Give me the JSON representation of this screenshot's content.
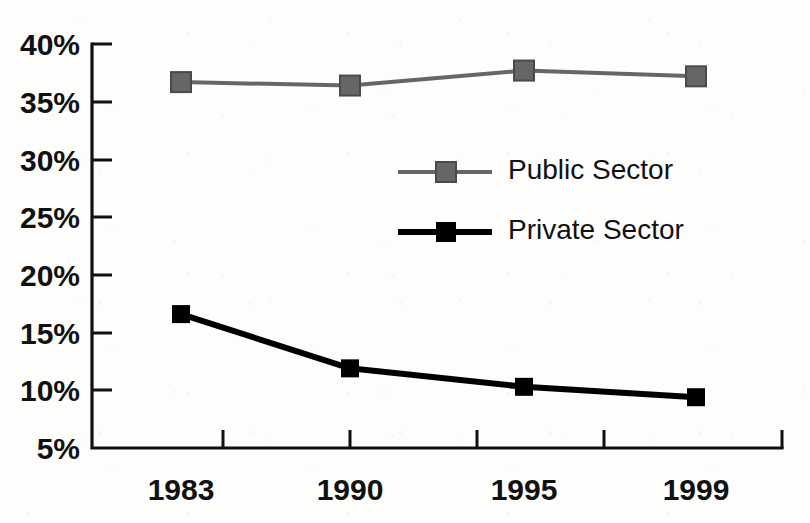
{
  "chart_data": {
    "type": "line",
    "title": "",
    "subtitle": "",
    "xlabel": "",
    "ylabel": "",
    "categories": [
      "1983",
      "1990",
      "1995",
      "1999"
    ],
    "series": [
      {
        "name": "Public Sector",
        "color": "#666666",
        "marker": "square",
        "line_width": 2,
        "values": [
          36.7,
          36.4,
          37.7,
          37.2
        ]
      },
      {
        "name": "Private Sector",
        "color": "#000000",
        "marker": "square",
        "line_width": 4,
        "values": [
          16.6,
          11.9,
          10.3,
          9.4
        ]
      }
    ],
    "ylim": [
      5,
      40
    ],
    "ytick_values": [
      5,
      10,
      15,
      20,
      25,
      30,
      35,
      40
    ],
    "ytick_labels": [
      "5%",
      "10%",
      "15%",
      "20%",
      "25%",
      "30%",
      "35%",
      "40%"
    ],
    "xtick_labels": [
      "1983",
      "1990",
      "1995",
      "1999"
    ],
    "grid": false,
    "legend_position": "center",
    "legend_entries": [
      "Public Sector",
      "Private Sector"
    ],
    "value_suffix": "%"
  },
  "axes": {
    "y_labels": [
      "40%",
      "35%",
      "30%",
      "25%",
      "20%",
      "15%",
      "10%",
      "5%"
    ],
    "x_labels": [
      "1983",
      "1990",
      "1995",
      "1999"
    ]
  },
  "legend": {
    "items": [
      {
        "label": "Public Sector",
        "color": "#666666"
      },
      {
        "label": "Private Sector",
        "color": "#000000"
      }
    ]
  },
  "colors": {
    "public_sector": "#666666",
    "private_sector": "#000000",
    "axis": "#111111",
    "background": "#fdfdfc"
  }
}
